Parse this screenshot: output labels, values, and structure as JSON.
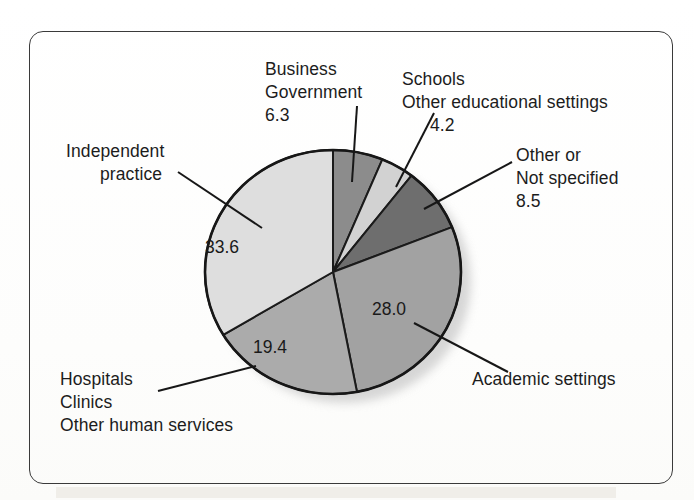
{
  "figure": {
    "background_color": "#ffffff",
    "frame_color": "#3a3a3a"
  },
  "chart_data": {
    "type": "pie",
    "title": "",
    "subtitle": "",
    "xlabel": "",
    "ylabel": "",
    "legend_position": "callout-labels",
    "grid": false,
    "units": "percent",
    "start_angle_deg": 0,
    "direction": "clockwise",
    "center": {
      "x": 333,
      "y": 272
    },
    "radius": {
      "rx": 128,
      "ry": 122
    },
    "categories": [
      "Business Government",
      "Schools Other educational settings",
      "Other or Not specified",
      "Academic settings",
      "Hospitals Clinics Other human services",
      "Independent practice"
    ],
    "values": [
      6.3,
      4.2,
      8.5,
      28.0,
      19.4,
      33.6
    ],
    "value_labels": [
      "6.3",
      "4.2",
      "8.5",
      "28.0",
      "19.4",
      "33.6"
    ],
    "colors": [
      "#8c8c8c",
      "#d2d2d2",
      "#6e6e6e",
      "#a2a2a2",
      "#ababab",
      "#dedede"
    ],
    "slices": [
      {
        "id": "business-government",
        "label_lines": [
          "Business",
          "Government"
        ],
        "value": 6.3,
        "value_label": "6.3",
        "color": "#8c8c8c",
        "value_inside": false
      },
      {
        "id": "schools-education",
        "label_lines": [
          "Schools",
          "Other educational settings"
        ],
        "value": 4.2,
        "value_label": "4.2",
        "color": "#d2d2d2",
        "value_inside": false
      },
      {
        "id": "other-not-specified",
        "label_lines": [
          "Other or",
          "Not specified"
        ],
        "value": 8.5,
        "value_label": "8.5",
        "color": "#6e6e6e",
        "value_inside": false
      },
      {
        "id": "academic-settings",
        "label_lines": [
          "Academic settings"
        ],
        "value": 28.0,
        "value_label": "28.0",
        "color": "#a2a2a2",
        "value_inside": true
      },
      {
        "id": "hospitals-clinics",
        "label_lines": [
          "Hospitals",
          "Clinics",
          "Other human services"
        ],
        "value": 19.4,
        "value_label": "19.4",
        "color": "#ababab",
        "value_inside": true
      },
      {
        "id": "independent-practice",
        "label_lines": [
          "Independent",
          "practice"
        ],
        "value": 33.6,
        "value_label": "33.6",
        "color": "#dedede",
        "value_inside": true
      }
    ]
  },
  "labels": {
    "business": {
      "line1": "Business",
      "line2": "Government",
      "line3": "6.3"
    },
    "schools": {
      "line1": "Schools",
      "line2": "Other educational settings",
      "line3": "4.2"
    },
    "other": {
      "line1": "Other or",
      "line2": "Not specified",
      "line3": "8.5"
    },
    "independent": {
      "line1": "Independent",
      "line2": "practice"
    },
    "hospitals": {
      "line1": "Hospitals",
      "line2": "Clinics",
      "line3": "Other human services"
    },
    "academic": {
      "line1": "Academic settings"
    }
  },
  "values_inside": {
    "independent": "33.6",
    "hospitals": "19.4",
    "academic": "28.0"
  }
}
